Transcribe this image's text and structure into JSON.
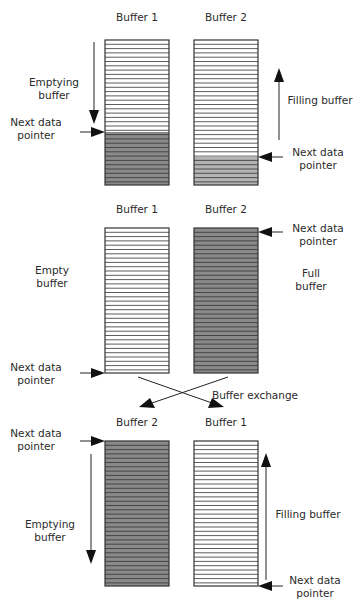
{
  "diagram": {
    "colors": {
      "outline": "#333333",
      "line": "#333333",
      "empty_fill": "#ffffff",
      "full_fill": "#8a8a8a",
      "partial_fill": "#b4b4b4",
      "text": "#2a2a2a"
    },
    "line_spacing": 4.3,
    "stages": [
      {
        "id": "stage-1",
        "buffers": [
          {
            "label": "Buffer 1",
            "x": 105,
            "y": 40,
            "w": 64,
            "h": 145,
            "filled_from": 132,
            "fill": "full_fill"
          },
          {
            "label": "Buffer 2",
            "x": 194,
            "y": 40,
            "w": 64,
            "h": 145,
            "filled_from": 157,
            "fill": "partial_fill"
          }
        ],
        "labels": {
          "buffer1": "Buffer 1",
          "buffer2": "Buffer 2",
          "left_action_1": "Emptying",
          "left_action_2": "buffer",
          "left_pointer_1": "Next data",
          "left_pointer_2": "pointer",
          "right_action": "Filling buffer",
          "right_pointer_1": "Next data",
          "right_pointer_2": "pointer"
        }
      },
      {
        "id": "stage-2",
        "buffers": [
          {
            "label": "Buffer 1",
            "x": 105,
            "y": 228,
            "w": 64,
            "h": 145,
            "filled_from": 373,
            "fill": "full_fill"
          },
          {
            "label": "Buffer 2",
            "x": 194,
            "y": 228,
            "w": 64,
            "h": 145,
            "filled_from": 228,
            "fill": "full_fill"
          }
        ],
        "labels": {
          "buffer1": "Buffer 1",
          "buffer2": "Buffer 2",
          "left_state_1": "Empty",
          "left_state_2": "buffer",
          "left_pointer_1": "Next data",
          "left_pointer_2": "pointer",
          "right_pointer_1": "Next data",
          "right_pointer_2": "pointer",
          "right_state_1": "Full",
          "right_state_2": "buffer",
          "exchange": "Buffer exchange"
        }
      },
      {
        "id": "stage-3",
        "buffers": [
          {
            "label": "Buffer 2",
            "x": 105,
            "y": 441,
            "w": 64,
            "h": 145,
            "filled_from": 441,
            "fill": "full_fill"
          },
          {
            "label": "Buffer 1",
            "x": 194,
            "y": 441,
            "w": 64,
            "h": 145,
            "filled_from": 586,
            "fill": "full_fill"
          }
        ],
        "labels": {
          "buffer_left": "Buffer 2",
          "buffer_right": "Buffer 1",
          "left_pointer_1": "Next data",
          "left_pointer_2": "pointer",
          "left_action_1": "Emptying",
          "left_action_2": "buffer",
          "right_action": "Filling buffer",
          "right_pointer_1": "Next data",
          "right_pointer_2": "pointer"
        }
      }
    ]
  }
}
